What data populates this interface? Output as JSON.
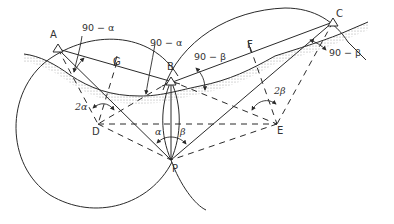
{
  "diagram": {
    "points": {
      "A": {
        "label": "A",
        "x": 58,
        "y": 49
      },
      "B": {
        "label": "B",
        "x": 171,
        "y": 81
      },
      "C": {
        "label": "C",
        "x": 333,
        "y": 22
      },
      "D": {
        "label": "D",
        "x": 98,
        "y": 124
      },
      "E": {
        "label": "E",
        "x": 277,
        "y": 124
      },
      "P": {
        "label": "P",
        "x": 171,
        "y": 160
      },
      "G": {
        "label": "G",
        "x": 117,
        "y": 58
      },
      "F": {
        "label": "F",
        "x": 250,
        "y": 43
      }
    },
    "angle_labels": {
      "a1": "90 − α",
      "a2": "90 − α",
      "b1": "90 − β",
      "b2": "90 − β",
      "two_alpha": "2α",
      "two_beta": "2β",
      "alpha": "α",
      "beta": "β"
    },
    "colors": {
      "stroke": "#2a2a2a",
      "ground_hatch": "#9a9a9a"
    }
  }
}
